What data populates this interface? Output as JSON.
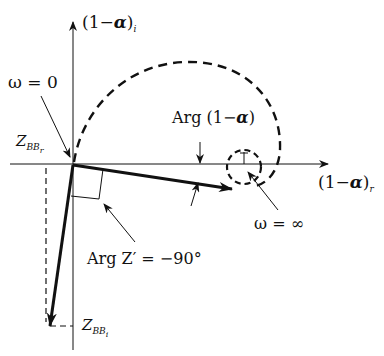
{
  "figure": {
    "type": "nyquist-style complex-plane diagram",
    "axes": {
      "vertical_label_main": "(1−",
      "vertical_label_alpha": "α",
      "vertical_label_close": ")",
      "vertical_label_sub": "i",
      "horizontal_label_main": "(1−",
      "horizontal_label_alpha": "α",
      "horizontal_label_close": ")",
      "horizontal_label_sub": "r"
    },
    "annotations": {
      "omega_zero": "ω = 0",
      "omega_infinity": "ω = ∞",
      "arg_one_minus_alpha_prefix": "Arg (1−",
      "arg_one_minus_alpha_alpha": "α",
      "arg_one_minus_alpha_close": ")",
      "arg_z_prime": "Arg Z′ = −90°",
      "z_bb_r_main": "Z",
      "z_bb_r_sub": "BB",
      "z_bb_r_subsub": "r",
      "z_bb_i_main": "Z",
      "z_bb_i_sub": "BB",
      "z_bb_i_subsub": "i"
    },
    "colors": {
      "ink": "#111111",
      "background": "#ffffff"
    }
  }
}
